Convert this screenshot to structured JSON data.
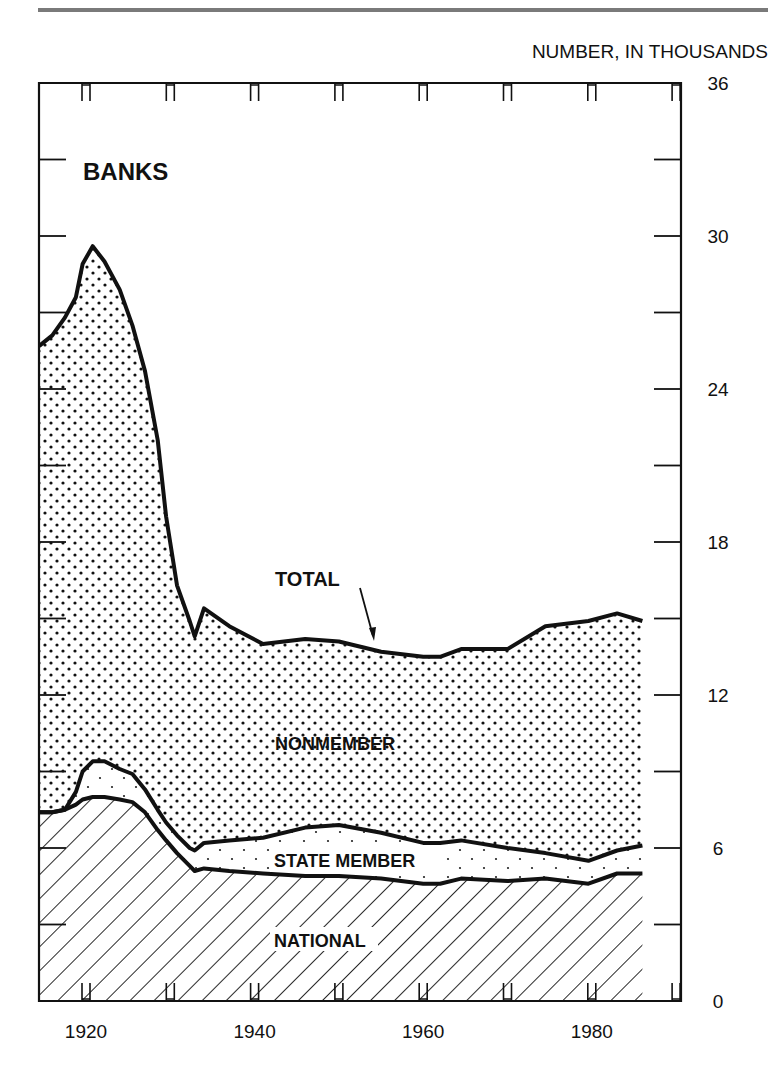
{
  "page": {
    "header_rule_color": "#7a7a7a"
  },
  "chart_data": {
    "type": "area",
    "stacked": true,
    "title": "BANKS",
    "ylabel": "NUMBER, IN THOUSANDS",
    "xlabel": "",
    "xlim": [
      1914.4,
      1990.8
    ],
    "ylim": [
      0,
      36
    ],
    "x_ticks": [
      1920,
      1930,
      1940,
      1950,
      1960,
      1970,
      1980,
      1990
    ],
    "x_tick_labels": [
      "1920",
      "1940",
      "1960",
      "1980"
    ],
    "x_tick_label_years": [
      1920,
      1940,
      1960,
      1980
    ],
    "y_ticks": [
      0,
      3,
      6,
      9,
      12,
      15,
      18,
      21,
      24,
      27,
      30,
      33,
      36
    ],
    "y_tick_labels": [
      "0",
      "6",
      "12",
      "18",
      "24",
      "30",
      "36"
    ],
    "y_tick_label_values": [
      0,
      6,
      12,
      18,
      24,
      30,
      36
    ],
    "y_axis_position": "right",
    "grid": false,
    "legend": "inline labels",
    "x": [
      1914.5,
      1916,
      1917.5,
      1918.8,
      1919.6,
      1920.8,
      1922.2,
      1924,
      1925.5,
      1927,
      1928.5,
      1929.5,
      1930.8,
      1932.3,
      1932.9,
      1934,
      1937,
      1941,
      1946,
      1950,
      1955,
      1960,
      1962,
      1964.5,
      1970,
      1974.5,
      1979.6,
      1983,
      1986
    ],
    "series": [
      {
        "name": "TOTAL",
        "values": [
          25.7,
          26.1,
          26.8,
          27.6,
          28.9,
          29.6,
          29.0,
          27.9,
          26.5,
          24.7,
          22.0,
          19.0,
          16.3,
          14.9,
          14.3,
          15.4,
          14.7,
          14.0,
          14.2,
          14.1,
          13.7,
          13.5,
          13.5,
          13.8,
          13.8,
          14.7,
          14.9,
          15.2,
          14.9
        ]
      },
      {
        "name": "MEMBER (NATIONAL + STATE MEMBER)",
        "values": [
          7.4,
          7.4,
          7.5,
          8.2,
          9.0,
          9.4,
          9.4,
          9.1,
          8.9,
          8.3,
          7.5,
          7.0,
          6.5,
          6.0,
          5.9,
          6.2,
          6.3,
          6.4,
          6.8,
          6.9,
          6.6,
          6.2,
          6.2,
          6.3,
          6.0,
          5.8,
          5.5,
          5.9,
          6.1
        ]
      },
      {
        "name": "NATIONAL",
        "values": [
          7.4,
          7.4,
          7.5,
          7.7,
          7.9,
          8.0,
          8.0,
          7.9,
          7.8,
          7.4,
          6.7,
          6.3,
          5.8,
          5.3,
          5.1,
          5.2,
          5.1,
          5.0,
          4.9,
          4.9,
          4.8,
          4.6,
          4.6,
          4.8,
          4.7,
          4.8,
          4.6,
          5.0,
          5.0
        ]
      }
    ],
    "regions": [
      {
        "name": "NONMEMBER",
        "pattern": "dots-dense"
      },
      {
        "name": "STATE MEMBER",
        "pattern": "dots-sparse"
      },
      {
        "name": "NATIONAL",
        "pattern": "diagonal-hatch"
      }
    ],
    "annotations": [
      {
        "text": "BANKS",
        "role": "panel-title"
      },
      {
        "text": "TOTAL",
        "role": "line-label",
        "arrow_to": [
          1955,
          13.7
        ]
      },
      {
        "text": "NONMEMBER",
        "role": "region-label"
      },
      {
        "text": "STATE MEMBER",
        "role": "region-label"
      },
      {
        "text": "NATIONAL",
        "role": "region-label"
      }
    ]
  }
}
